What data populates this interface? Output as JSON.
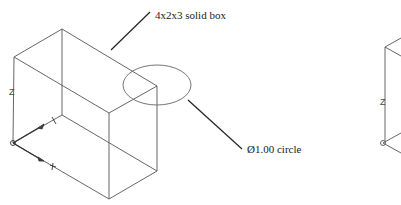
{
  "annotations": {
    "box_label": "4x2x3 solid box",
    "circle_label": "Ø1.00 circle"
  },
  "axes": {
    "z_label": "Z"
  },
  "colors": {
    "line": "#555555",
    "leader": "#222222",
    "text": "#1a1a1a"
  }
}
